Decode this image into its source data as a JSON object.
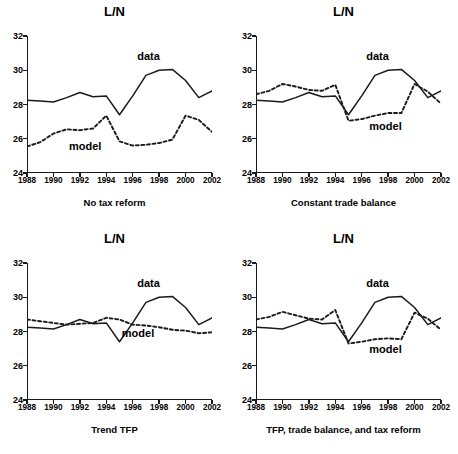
{
  "figure": {
    "width": 458,
    "height": 454,
    "background": "#ffffff",
    "line_color": "#1a1a1a"
  },
  "axes": {
    "ylabel_title": "L/N",
    "yticks": [
      24,
      26,
      28,
      30,
      32
    ],
    "ytick_labels": [
      "24",
      "26",
      "28",
      "30",
      "32"
    ],
    "ylim": [
      24,
      32
    ],
    "xticks": [
      1988,
      1990,
      1992,
      1994,
      1996,
      1998,
      2000,
      2002
    ],
    "xtick_labels": [
      "1988",
      "1990",
      "1992",
      "1994",
      "1996",
      "1998",
      "2000",
      "2002"
    ],
    "xlim": [
      1988,
      2002
    ]
  },
  "legend": {
    "data_label": "data",
    "model_label": "model"
  },
  "chart_data": [
    {
      "type": "line",
      "title": "L/N",
      "caption": "No tax reform",
      "xlabel": "",
      "ylabel": "L/N",
      "xlim": [
        1988,
        2002
      ],
      "ylim": [
        24,
        32
      ],
      "grid": false,
      "legend_position": "inline-annotation",
      "x": [
        1988,
        1989,
        1990,
        1991,
        1992,
        1993,
        1994,
        1995,
        1996,
        1997,
        1998,
        1999,
        2000,
        2001,
        2002
      ],
      "series": [
        {
          "name": "data",
          "style": "solid",
          "values": [
            28.25,
            28.2,
            28.15,
            28.4,
            28.7,
            28.45,
            28.5,
            27.4,
            28.5,
            29.7,
            30.0,
            30.05,
            29.4,
            28.4,
            28.8
          ]
        },
        {
          "name": "model",
          "style": "dashed",
          "values": [
            25.55,
            25.8,
            26.3,
            26.55,
            26.5,
            26.6,
            27.35,
            25.85,
            25.6,
            25.65,
            25.75,
            25.95,
            27.35,
            27.1,
            26.4
          ]
        }
      ],
      "annotations": [
        {
          "text": "data",
          "x": 1997.2,
          "y": 30.85
        },
        {
          "text": "model",
          "x": 1992.4,
          "y": 25.6
        }
      ]
    },
    {
      "type": "line",
      "title": "L/N",
      "caption": "Constant trade balance",
      "xlabel": "",
      "ylabel": "L/N",
      "xlim": [
        1988,
        2002
      ],
      "ylim": [
        24,
        32
      ],
      "grid": false,
      "legend_position": "inline-annotation",
      "x": [
        1988,
        1989,
        1990,
        1991,
        1992,
        1993,
        1994,
        1995,
        1996,
        1997,
        1998,
        1999,
        2000,
        2001,
        2002
      ],
      "series": [
        {
          "name": "data",
          "style": "solid",
          "values": [
            28.25,
            28.2,
            28.15,
            28.4,
            28.7,
            28.45,
            28.5,
            27.4,
            28.5,
            29.7,
            30.0,
            30.05,
            29.4,
            28.4,
            28.8
          ]
        },
        {
          "name": "model",
          "style": "dashed",
          "values": [
            28.6,
            28.8,
            29.2,
            29.05,
            28.85,
            28.8,
            29.15,
            27.05,
            27.15,
            27.35,
            27.5,
            27.5,
            29.2,
            28.75,
            28.05
          ]
        }
      ],
      "annotations": [
        {
          "text": "data",
          "x": 1997.2,
          "y": 30.85
        },
        {
          "text": "model",
          "x": 1997.8,
          "y": 26.75
        }
      ]
    },
    {
      "type": "line",
      "title": "L/N",
      "caption": "Trend TFP",
      "xlabel": "",
      "ylabel": "L/N",
      "xlim": [
        1988,
        2002
      ],
      "ylim": [
        24,
        32
      ],
      "grid": false,
      "legend_position": "inline-annotation",
      "x": [
        1988,
        1989,
        1990,
        1991,
        1992,
        1993,
        1994,
        1995,
        1996,
        1997,
        1998,
        1999,
        2000,
        2001,
        2002
      ],
      "series": [
        {
          "name": "data",
          "style": "solid",
          "values": [
            28.25,
            28.2,
            28.15,
            28.4,
            28.7,
            28.45,
            28.5,
            27.4,
            28.5,
            29.7,
            30.0,
            30.05,
            29.4,
            28.4,
            28.8
          ]
        },
        {
          "name": "model",
          "style": "dashed",
          "values": [
            28.7,
            28.6,
            28.5,
            28.4,
            28.45,
            28.5,
            28.8,
            28.7,
            28.4,
            28.35,
            28.25,
            28.1,
            28.05,
            27.9,
            27.95
          ]
        }
      ],
      "annotations": [
        {
          "text": "data",
          "x": 1997.2,
          "y": 30.85
        },
        {
          "text": "model",
          "x": 1996.4,
          "y": 27.9
        }
      ]
    },
    {
      "type": "line",
      "title": "L/N",
      "caption": "TFP, trade balance, and tax reform",
      "xlabel": "",
      "ylabel": "L/N",
      "xlim": [
        1988,
        2002
      ],
      "ylim": [
        24,
        32
      ],
      "grid": false,
      "legend_position": "inline-annotation",
      "x": [
        1988,
        1989,
        1990,
        1991,
        1992,
        1993,
        1994,
        1995,
        1996,
        1997,
        1998,
        1999,
        2000,
        2001,
        2002
      ],
      "series": [
        {
          "name": "data",
          "style": "solid",
          "values": [
            28.25,
            28.2,
            28.15,
            28.4,
            28.7,
            28.45,
            28.5,
            27.4,
            28.5,
            29.7,
            30.0,
            30.05,
            29.4,
            28.4,
            28.8
          ]
        },
        {
          "name": "model",
          "style": "dashed",
          "values": [
            28.7,
            28.85,
            29.15,
            28.95,
            28.75,
            28.7,
            29.25,
            27.3,
            27.4,
            27.55,
            27.6,
            27.55,
            29.1,
            28.75,
            28.1
          ]
        }
      ],
      "annotations": [
        {
          "text": "data",
          "x": 1997.2,
          "y": 30.85
        },
        {
          "text": "model",
          "x": 1997.8,
          "y": 26.95
        }
      ]
    }
  ],
  "panels": [
    {
      "id": "no-tax-reform",
      "title": "L/N",
      "caption": "No tax reform"
    },
    {
      "id": "constant-trade-balance",
      "title": "L/N",
      "caption": "Constant trade balance"
    },
    {
      "id": "trend-tfp",
      "title": "L/N",
      "caption": "Trend TFP"
    },
    {
      "id": "tfp-trade-tax",
      "title": "L/N",
      "caption": "TFP, trade balance, and tax reform"
    }
  ]
}
